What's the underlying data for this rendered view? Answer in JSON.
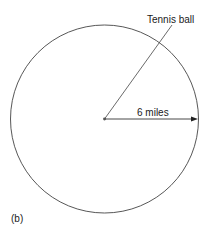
{
  "diagram": {
    "panel_label": "(b)",
    "pointer_label": "Tennis ball",
    "radius_label": "6 miles",
    "colors": {
      "stroke": "#333333",
      "text": "#1a1a1a",
      "background": "#ffffff"
    }
  }
}
